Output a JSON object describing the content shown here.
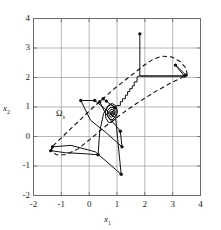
{
  "figure": {
    "background": "#ffffff",
    "frame_color": "#6b6b6b",
    "grid_color": "#9a9a9a",
    "trajectory_color": "#111111",
    "set_color": "#111111"
  },
  "labels": {
    "xlabel_base": "x",
    "xlabel_sub": "1",
    "ylabel_base": "x",
    "ylabel_sub": "2",
    "set_base": "Ω",
    "set_sub": "s"
  },
  "chart_data": {
    "type": "line",
    "title": "",
    "xlabel": "x1",
    "ylabel": "x2",
    "xlim": [
      -2,
      4
    ],
    "ylim": [
      -2,
      4
    ],
    "xticks": [
      -2,
      -1,
      0,
      1,
      2,
      3,
      4
    ],
    "yticks": [
      -2,
      -1,
      0,
      1,
      2,
      3,
      4
    ],
    "xticklabels": [
      "-2",
      "-1",
      "0",
      "1",
      "2",
      "3",
      "4"
    ],
    "yticklabels": [
      "-2",
      "-1",
      "0",
      "1",
      "2",
      "3",
      "4"
    ],
    "grid": true,
    "legend": null,
    "annotations": [
      {
        "text": "Ωs",
        "x": -0.55,
        "y": 0.47,
        "note": "label for invariant set boundary"
      }
    ],
    "series": [
      {
        "name": "invariant-set-boundary",
        "style": "dashed",
        "closed": true,
        "linewidth": 1.1,
        "points": [
          [
            -1.3,
            -0.32
          ],
          [
            -0.62,
            0.3
          ],
          [
            0.1,
            0.95
          ],
          [
            0.9,
            1.62
          ],
          [
            1.55,
            2.1
          ],
          [
            1.95,
            2.4
          ],
          [
            2.3,
            2.62
          ],
          [
            2.62,
            2.72
          ],
          [
            2.95,
            2.7
          ],
          [
            3.25,
            2.55
          ],
          [
            3.48,
            2.32
          ],
          [
            3.52,
            2.12
          ],
          [
            3.3,
            1.98
          ],
          [
            2.9,
            1.8
          ],
          [
            2.3,
            1.48
          ],
          [
            1.7,
            1.12
          ],
          [
            1.1,
            0.72
          ],
          [
            0.55,
            0.32
          ],
          [
            0.05,
            -0.08
          ],
          [
            -0.4,
            -0.42
          ],
          [
            -0.85,
            -0.62
          ],
          [
            -1.18,
            -0.62
          ],
          [
            -1.36,
            -0.48
          ],
          [
            -1.3,
            -0.32
          ]
        ]
      },
      {
        "name": "state-trajectory",
        "style": "solid",
        "linewidth": 1.0,
        "marker": "dot",
        "points": [
          [
            1.82,
            3.48
          ],
          [
            1.82,
            2.05
          ],
          [
            1.82,
            2.05
          ],
          [
            3.42,
            2.05
          ],
          [
            3.42,
            2.05
          ],
          [
            3.1,
            2.42
          ],
          [
            3.1,
            2.42
          ],
          [
            3.48,
            2.08
          ],
          [
            3.48,
            2.08
          ],
          [
            3.4,
            2.05
          ],
          [
            1.8,
            2.05
          ],
          [
            1.72,
            2.02
          ],
          [
            1.72,
            1.85
          ],
          [
            1.62,
            1.85
          ],
          [
            1.62,
            1.72
          ],
          [
            1.55,
            1.72
          ],
          [
            1.55,
            1.62
          ],
          [
            1.46,
            1.62
          ],
          [
            1.46,
            1.52
          ],
          [
            1.38,
            1.52
          ],
          [
            1.38,
            1.4
          ],
          [
            1.3,
            1.4
          ],
          [
            1.3,
            1.28
          ],
          [
            1.2,
            1.28
          ],
          [
            1.2,
            1.18
          ],
          [
            1.12,
            1.18
          ],
          [
            1.12,
            1.05
          ],
          [
            1.0,
            1.05
          ],
          [
            0.92,
            0.98
          ],
          [
            0.78,
            1.08
          ],
          [
            0.62,
            1.2
          ],
          [
            0.5,
            1.28
          ],
          [
            0.38,
            1.18
          ],
          [
            0.55,
            0.85
          ],
          [
            0.78,
            0.55
          ],
          [
            0.95,
            0.38
          ],
          [
            1.12,
            0.18
          ],
          [
            1.18,
            -0.35
          ],
          [
            0.62,
            0.12
          ],
          [
            0.05,
            0.55
          ],
          [
            -0.3,
            1.22
          ],
          [
            0.2,
            1.22
          ],
          [
            0.55,
            0.95
          ],
          [
            0.95,
            0.62
          ],
          [
            1.15,
            -1.28
          ],
          [
            0.22,
            -0.52
          ],
          [
            -0.65,
            -0.3
          ],
          [
            -1.32,
            -0.35
          ],
          [
            -1.38,
            -0.48
          ],
          [
            -0.85,
            -0.55
          ],
          [
            -0.22,
            -0.58
          ],
          [
            0.32,
            -0.62
          ],
          [
            0.38,
            0.18
          ],
          [
            0.52,
            0.78
          ],
          [
            0.68,
            1.05
          ],
          [
            0.82,
            1.12
          ],
          [
            0.95,
            1.05
          ],
          [
            1.02,
            0.85
          ],
          [
            0.95,
            0.62
          ],
          [
            0.82,
            0.48
          ],
          [
            0.7,
            0.48
          ],
          [
            0.6,
            0.62
          ],
          [
            0.58,
            0.82
          ],
          [
            0.65,
            1.0
          ],
          [
            0.78,
            1.08
          ],
          [
            0.9,
            1.02
          ],
          [
            0.98,
            0.88
          ],
          [
            0.95,
            0.7
          ],
          [
            0.85,
            0.58
          ],
          [
            0.74,
            0.58
          ],
          [
            0.66,
            0.7
          ],
          [
            0.66,
            0.88
          ],
          [
            0.75,
            0.98
          ],
          [
            0.86,
            0.98
          ],
          [
            0.93,
            0.86
          ],
          [
            0.9,
            0.72
          ],
          [
            0.8,
            0.65
          ],
          [
            0.72,
            0.7
          ],
          [
            0.7,
            0.82
          ],
          [
            0.78,
            0.92
          ],
          [
            0.87,
            0.9
          ],
          [
            0.9,
            0.8
          ],
          [
            0.85,
            0.72
          ],
          [
            0.78,
            0.72
          ],
          [
            0.75,
            0.8
          ],
          [
            0.8,
            0.86
          ],
          [
            0.86,
            0.84
          ],
          [
            0.86,
            0.78
          ],
          [
            0.81,
            0.76
          ],
          [
            0.79,
            0.8
          ],
          [
            0.83,
            0.82
          ],
          [
            0.84,
            0.79
          ],
          [
            0.81,
            0.78
          ],
          [
            0.82,
            0.8
          ]
        ]
      },
      {
        "name": "trajectory-vertex-markers",
        "style": "markers",
        "points": [
          [
            1.82,
            3.48
          ],
          [
            3.42,
            2.05
          ],
          [
            3.1,
            2.42
          ],
          [
            3.48,
            2.08
          ],
          [
            -0.3,
            1.22
          ],
          [
            0.2,
            1.22
          ],
          [
            0.5,
            1.28
          ],
          [
            0.38,
            1.18
          ],
          [
            1.18,
            -0.35
          ],
          [
            1.15,
            -1.28
          ],
          [
            1.12,
            0.18
          ],
          [
            -1.32,
            -0.35
          ],
          [
            -1.38,
            -0.48
          ],
          [
            0.32,
            -0.62
          ],
          [
            0.92,
            0.98
          ],
          [
            0.62,
            1.2
          ]
        ]
      }
    ]
  }
}
